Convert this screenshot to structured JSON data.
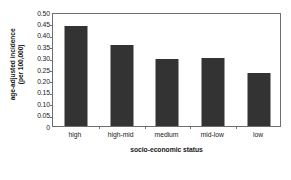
{
  "chart_data": {
    "type": "bar",
    "title": "",
    "categories": [
      "high",
      "high-mid",
      "medium",
      "mid-low",
      "low"
    ],
    "values": [
      0.44,
      0.355,
      0.295,
      0.3,
      0.233
    ],
    "series": [
      {
        "name": "age-adjusted incidence",
        "values": [
          0.44,
          0.355,
          0.295,
          0.3,
          0.233
        ]
      }
    ],
    "xlabel": "socio-economic status",
    "ylabel_line1": "age-adjusted incidence",
    "ylabel_line2": "(per 100,000)",
    "ylabel": "age-adjusted incidence (per 100,000)",
    "ylim": [
      0,
      0.5
    ],
    "yticks": [
      0.5,
      0.45,
      0.4,
      0.35,
      0.3,
      0.25,
      0.2,
      0.15,
      0.1,
      0.05,
      0
    ],
    "ytick_labels": [
      "0.50",
      "0.45",
      "0.40",
      "0.35",
      "0.30",
      "0.25",
      "0.20",
      "0.15",
      "0.10",
      "0.05",
      "0"
    ],
    "grid": false,
    "legend": null,
    "legend_position": "none",
    "bar_color": "#333333",
    "axis_color": "#6e6e6e",
    "background_color": "#ffffff",
    "plot_border": true
  }
}
